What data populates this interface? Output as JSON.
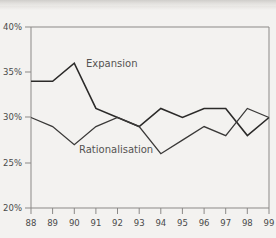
{
  "chart_data": {
    "type": "line",
    "title": "",
    "subtitle": "",
    "xlabel": "",
    "ylabel": "",
    "x": [
      "88",
      "89",
      "90",
      "91",
      "92",
      "93",
      "94",
      "95",
      "96",
      "97",
      "98",
      "99"
    ],
    "categories": [
      "88",
      "89",
      "90",
      "91",
      "92",
      "93",
      "94",
      "95",
      "96",
      "97",
      "98",
      "99"
    ],
    "xlim": [
      88,
      99
    ],
    "ylim": [
      20,
      40
    ],
    "ytick_labels": [
      "40%",
      "35%",
      "30%",
      "25%",
      "20%"
    ],
    "ytick_values": [
      40,
      35,
      30,
      25,
      20
    ],
    "grid": false,
    "legend_position": "inline-annotation",
    "series": [
      {
        "name": "Expansion",
        "label": "Expansion",
        "color": "#2b2a29",
        "values": [
          34,
          34,
          36,
          31,
          30,
          29,
          31,
          30,
          31,
          31,
          28,
          30
        ]
      },
      {
        "name": "Rationalisation",
        "label": "Rationalisation",
        "color": "#3a3938",
        "values": [
          30,
          29,
          27,
          29,
          30,
          29,
          26,
          27.5,
          29,
          28,
          31,
          30
        ]
      }
    ],
    "annotations": [
      {
        "text": "Expansion",
        "x": 91.1,
        "y": 34.9
      },
      {
        "text": "Rationalisation",
        "x": 90.6,
        "y": 27.1
      }
    ]
  },
  "axes": {
    "y_ticks": [
      {
        "label": "40%"
      },
      {
        "label": "35%"
      },
      {
        "label": "30%"
      },
      {
        "label": "25%"
      },
      {
        "label": "20%"
      }
    ],
    "x_ticks": [
      {
        "label": "88"
      },
      {
        "label": "89"
      },
      {
        "label": "90"
      },
      {
        "label": "91"
      },
      {
        "label": "92"
      },
      {
        "label": "93"
      },
      {
        "label": "94"
      },
      {
        "label": "95"
      },
      {
        "label": "96"
      },
      {
        "label": "97"
      },
      {
        "label": "98"
      },
      {
        "label": "99"
      }
    ]
  },
  "colors": {
    "background": "#f3f2f0",
    "axis": "#8b8987",
    "expansion": "#2b2a29",
    "rationalisation": "#3a3938",
    "label_text": "#4a4a4a",
    "series_label_text": "#555352"
  }
}
